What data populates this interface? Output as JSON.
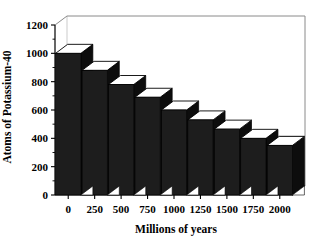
{
  "chart_data": {
    "type": "bar",
    "title": "",
    "xlabel": "Millions of years",
    "ylabel": "Atoms of Potassium-40",
    "categories": [
      "0",
      "250",
      "500",
      "750",
      "1000",
      "1250",
      "1500",
      "1750",
      "2000"
    ],
    "values": [
      1000,
      880,
      780,
      690,
      600,
      530,
      465,
      400,
      350
    ],
    "ylim": [
      0,
      1200
    ],
    "ytick_labels": [
      "0",
      "200",
      "400",
      "600",
      "800",
      "1000",
      "1200"
    ],
    "ytick_values": [
      0,
      200,
      400,
      600,
      800,
      1000,
      1200
    ],
    "yminor_step": 100,
    "grid": "horizontal-faint",
    "legend": "none",
    "style_3d": true,
    "bar_fill_color": "#1d1d1d",
    "bar_top_color": "#ffffff",
    "background_color": "#ffffff",
    "axis_color": "#000000"
  },
  "axes": {
    "y_title": "Atoms of Potassium-40",
    "x_title": "Millions of years"
  }
}
